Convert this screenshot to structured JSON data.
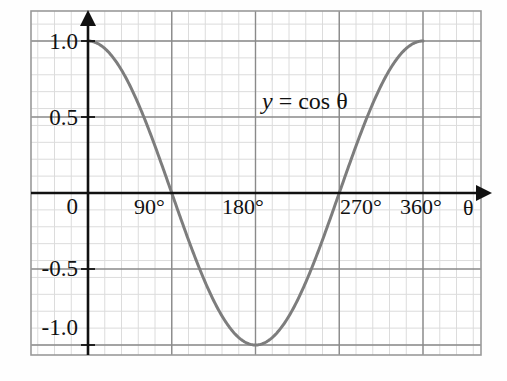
{
  "figure": {
    "caption_equation": "y = cos θ",
    "equation_var": "y",
    "equation_rest": " = cos θ"
  },
  "chart_data": {
    "type": "line",
    "title": "",
    "subtitle": "",
    "xlabel": "θ",
    "ylabel": "",
    "annotations": [
      "y = cos θ"
    ],
    "legend": [],
    "legend_position": "none",
    "grid": true,
    "grid_minor": true,
    "xlim": [
      -18,
      426
    ],
    "ylim": [
      -1.28,
      1.27
    ],
    "xticks": [
      0,
      90,
      180,
      270,
      360
    ],
    "xtick_labels": [
      "0",
      "90°",
      "180°",
      "270°",
      "360°"
    ],
    "yticks": [
      1.0,
      0.5,
      0,
      -0.5,
      -1.0
    ],
    "ytick_labels": [
      "1.0",
      "0.5",
      "0",
      "-0.5",
      "-1.0"
    ],
    "series": [
      {
        "name": "y = cos θ",
        "color": "#7d7d7d",
        "linewidth": 3,
        "x": [
          0,
          10,
          20,
          30,
          40,
          50,
          60,
          70,
          80,
          90,
          100,
          110,
          120,
          130,
          140,
          150,
          160,
          170,
          180,
          190,
          200,
          210,
          220,
          230,
          240,
          250,
          260,
          270,
          280,
          290,
          300,
          310,
          320,
          330,
          340,
          350,
          360
        ],
        "values": [
          1.0,
          0.985,
          0.94,
          0.866,
          0.766,
          0.643,
          0.5,
          0.342,
          0.174,
          0.0,
          -0.174,
          -0.342,
          -0.5,
          -0.643,
          -0.766,
          -0.866,
          -0.94,
          -0.985,
          -1.0,
          -0.985,
          -0.94,
          -0.866,
          -0.766,
          -0.643,
          -0.5,
          -0.342,
          -0.174,
          0.0,
          0.174,
          0.342,
          0.5,
          0.643,
          0.766,
          0.866,
          0.94,
          0.985,
          1.0
        ]
      }
    ],
    "key_points": {
      "maxima_deg": [
        0,
        360
      ],
      "minima_deg": [
        180
      ],
      "zeros_deg": [
        90,
        270
      ],
      "amplitude": 1.0,
      "period_deg": 360
    }
  },
  "axes": {
    "x_axis_arrow": "right-arrow",
    "y_axis_arrow": "up-arrow",
    "x_axis_variable": "θ",
    "colors": {
      "axis": "#111111",
      "major_grid": "#8a8a8a",
      "minor_grid": "#d9d9d9",
      "curve": "#7d7d7d",
      "border": "#9a9a9a"
    }
  },
  "tick_labels": {
    "y": [
      {
        "text": "1.0",
        "value": 1.0
      },
      {
        "text": "0.5",
        "value": 0.5
      },
      {
        "text": "0",
        "value": 0
      },
      {
        "text": "-0.5",
        "value": -0.5
      },
      {
        "text": "-1.0",
        "value": -1.0
      }
    ],
    "x": [
      {
        "text": "0",
        "value": 0
      },
      {
        "text": "90°",
        "value": 90
      },
      {
        "text": "180°",
        "value": 180
      },
      {
        "text": "270°",
        "value": 270
      },
      {
        "text": "360°",
        "value": 360
      }
    ]
  }
}
